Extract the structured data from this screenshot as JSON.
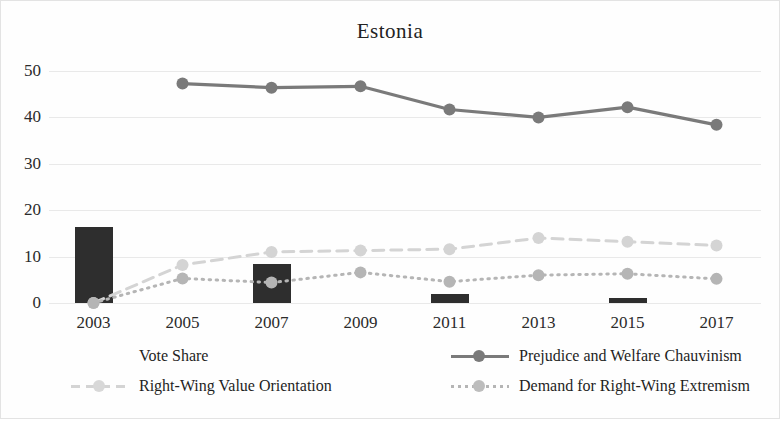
{
  "chart_data": {
    "type": "bar",
    "title": "Estonia",
    "xlabel": "",
    "ylabel": "",
    "ylim": [
      0,
      50
    ],
    "yticks": [
      0,
      10,
      20,
      30,
      40,
      50
    ],
    "grid": true,
    "legend_position": "bottom",
    "categories": [
      "2003",
      "2005",
      "2007",
      "2009",
      "2011",
      "2013",
      "2015",
      "2017"
    ],
    "series": [
      {
        "name": "Vote Share",
        "type": "bar",
        "color": "#2e2e2e",
        "values": [
          16.3,
          null,
          8.4,
          null,
          2.0,
          null,
          1.0,
          null
        ]
      },
      {
        "name": "Prejudice and Welfare Chauvinism",
        "type": "line",
        "style": "solid",
        "color": "#7a7a7a",
        "values": [
          null,
          47.3,
          46.4,
          46.7,
          41.7,
          40.0,
          42.2,
          38.4
        ]
      },
      {
        "name": "Right-Wing Value Orientation",
        "type": "line",
        "style": "dashed",
        "color": "#d4d4d4",
        "values": [
          0.0,
          8.2,
          11.0,
          11.3,
          11.6,
          14.0,
          13.2,
          12.4
        ]
      },
      {
        "name": "Demand for Right-Wing Extremism",
        "type": "line",
        "style": "dotted",
        "color": "#b5b5b5",
        "values": [
          0.0,
          5.3,
          4.4,
          6.6,
          4.6,
          6.0,
          6.3,
          5.2
        ]
      }
    ]
  },
  "legend": {
    "items": [
      {
        "label": "Vote Share",
        "swatch": "bar-swatch",
        "color": "#2e2e2e"
      },
      {
        "label": "Prejudice and Welfare Chauvinism",
        "swatch": "solid-line-swatch",
        "color": "#7a7a7a"
      },
      {
        "label": "Right-Wing Value Orientation",
        "swatch": "dashed-line-swatch",
        "color": "#d4d4d4"
      },
      {
        "label": "Demand for Right-Wing Extremism",
        "swatch": "dotted-line-swatch",
        "color": "#b5b5b5"
      }
    ]
  },
  "axes": {
    "y_tick_labels": [
      "50",
      "40",
      "30",
      "20",
      "10",
      "0"
    ],
    "x_tick_labels": [
      "2003",
      "2005",
      "2007",
      "2009",
      "2011",
      "2013",
      "2015",
      "2017"
    ]
  }
}
